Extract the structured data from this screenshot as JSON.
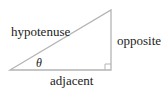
{
  "diagram": {
    "type": "right-triangle",
    "labels": {
      "hypotenuse": "hypotenuse",
      "opposite": "opposite",
      "adjacent": "adjacent",
      "angle": "θ"
    },
    "colors": {
      "stroke": "#b4b4b4",
      "text": "#222222",
      "background": "#ffffff"
    }
  }
}
